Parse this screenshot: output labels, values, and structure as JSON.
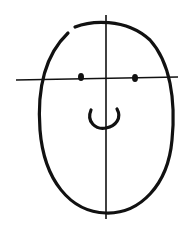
{
  "figure": {
    "colors": {
      "stroke": "#111111",
      "background": "#ffffff"
    },
    "elements": [
      "head-outline",
      "vertical-guide",
      "horizontal-guide",
      "left-eye",
      "right-eye",
      "mouth"
    ]
  }
}
